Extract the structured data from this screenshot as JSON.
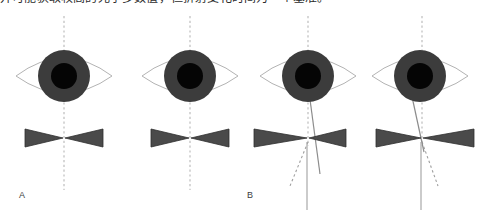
{
  "figure": {
    "caption_top": "并可能获取较高的光学多数值，但折射变化时间为一个基准。",
    "background_color": "#ffffff",
    "panel_labels": [
      {
        "id": "A",
        "text": "A"
      },
      {
        "id": "B",
        "text": "B"
      }
    ],
    "colors": {
      "eye_outline": "#b3b3b3",
      "iris": "#3c3c3c",
      "pupil": "#050505",
      "bowtie": "#4a4a4a",
      "bowtie_outline": "#2f2f2f",
      "axis_dashed": "#bdbdbd",
      "ray_solid": "#8c8c8c",
      "ray_dashed": "#9e9e9e",
      "label_text": "#3d3d3d"
    },
    "panels": [
      {
        "id": "panel-1",
        "group": "A",
        "eye_label": "eye-frontal-aligned",
        "has_vertical_dashed_axis": true,
        "has_bowtie": true,
        "has_ray_arrow": false,
        "description": "Eye with centered pupil and vertical dashed visual axis passing through bowtie center"
      },
      {
        "id": "panel-2",
        "group": "A",
        "eye_label": "eye-frontal-aligned",
        "has_vertical_dashed_axis": true,
        "has_bowtie": true,
        "has_ray_arrow": false,
        "description": "Second eye with centered pupil and vertical dashed visual axis through bowtie center"
      },
      {
        "id": "panel-3",
        "group": "B",
        "eye_label": "eye-with-oblique-ray",
        "has_vertical_dashed_axis": true,
        "has_bowtie": true,
        "has_ray_arrow": true,
        "ray_direction": "up-left",
        "description": "Eye with oblique solid ray arrow pointing up toward pupil, dashed extension below, plus solid vertical line"
      },
      {
        "id": "panel-4",
        "group": "B",
        "eye_label": "eye-with-oblique-ray",
        "has_vertical_dashed_axis": true,
        "has_bowtie": true,
        "has_ray_arrow": true,
        "ray_direction": "up-left",
        "description": "Eye with oblique solid ray arrow pointing up toward pupil, dashed extension below-right, plus solid vertical line"
      }
    ]
  }
}
